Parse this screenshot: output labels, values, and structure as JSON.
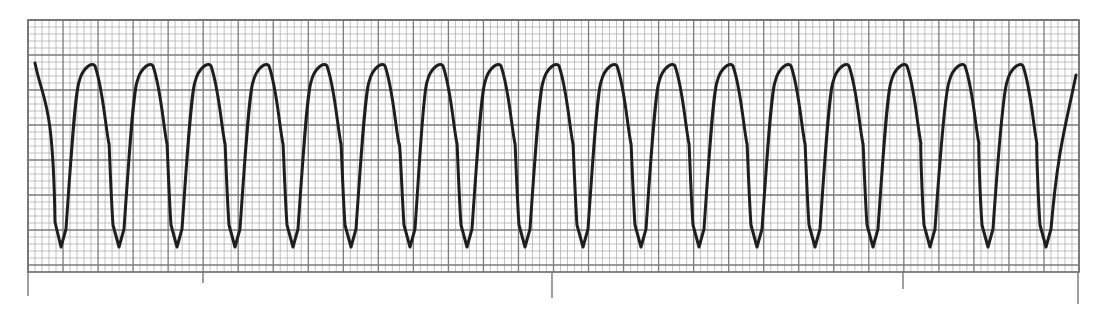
{
  "chart_data": {
    "type": "line",
    "title": "",
    "xlabel": "",
    "ylabel": "",
    "grid": {
      "on": true,
      "left": 28,
      "top": 20,
      "right": 1079,
      "bottom": 272,
      "small_box_px": 7,
      "large_box_px": 35,
      "small_line_color": "#a8a8a8",
      "large_line_color": "#7a7a7a",
      "border_color": "#6e6e6e"
    },
    "time_marks": [
      {
        "x": 28,
        "bottom": 296
      },
      {
        "x": 203,
        "bottom": 283
      },
      {
        "x": 552,
        "bottom": 298
      },
      {
        "x": 903,
        "bottom": 289
      },
      {
        "x": 1078,
        "bottom": 304
      }
    ],
    "trace": {
      "color": "#1e1e1e",
      "width": 3,
      "start": {
        "x": 35,
        "y": 63
      },
      "end": {
        "x": 1076,
        "y": 75
      },
      "peak_y": 64,
      "trough_y": 247,
      "troughs_x": [
        61,
        119,
        177,
        235,
        293,
        351,
        410,
        467,
        525,
        583,
        641,
        699,
        757,
        815,
        873,
        930,
        988,
        1046
      ],
      "peaks_x": [
        91,
        149,
        207,
        265,
        323,
        381,
        439,
        497,
        555,
        613,
        671,
        729,
        787,
        845,
        903,
        961,
        1019
      ],
      "complex_count": 18,
      "cycle_period_px": 58
    }
  }
}
